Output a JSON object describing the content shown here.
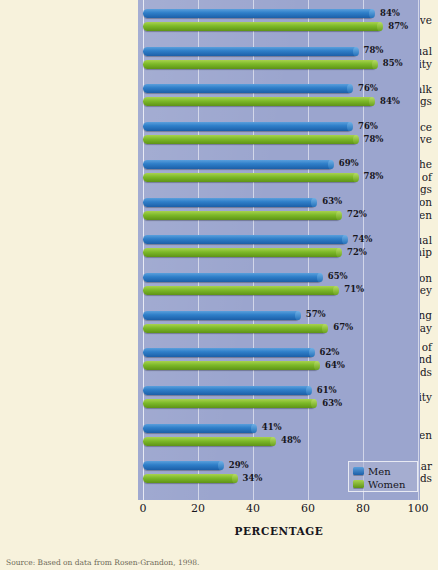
{
  "chart_data": {
    "type": "bar",
    "orientation": "horizontal",
    "title": "",
    "xlabel": "PERCENTAGE",
    "ylabel": "",
    "xlim": [
      0,
      100
    ],
    "xticks": [
      "0",
      "20",
      "40",
      "60",
      "80",
      "100"
    ],
    "grid": true,
    "legend_position": "bottom-right",
    "categories": [
      "Being in love",
      "Spouse's sexual fidelity",
      "Being able to talk together about feelings",
      "Keeping romance alive",
      "Being able to see the humorous side of things",
      "Having similar ideas on how to raise children",
      "Having a good sexual relationship",
      "Having similar ideas on how to handle money",
      "Spouse understanding what you do every day",
      "Liking the same kind of lifestyle, activities, and friends",
      "Financial security",
      "Having children",
      "Having similar backgrounds"
    ],
    "category_lines": [
      [
        "Being in love"
      ],
      [
        "Spouse's sexual",
        "fidelity"
      ],
      [
        "Being able to talk",
        "together about feelings"
      ],
      [
        "Keeping romance",
        "alive"
      ],
      [
        "Being able to see the",
        "humorous side of things"
      ],
      [
        "Having similar ideas on",
        "how to raise children"
      ],
      [
        "Having a good sexual",
        "relationship"
      ],
      [
        "Having similar ideas on",
        "how to handle money"
      ],
      [
        "Spouse understanding",
        "what you do every day"
      ],
      [
        "Liking the same kind of",
        "lifestyle, activities, and",
        "friends"
      ],
      [
        "Financial security"
      ],
      [
        "Having children"
      ],
      [
        "Having similar",
        "backgrounds"
      ]
    ],
    "series": [
      {
        "name": "Men",
        "color": "#2878c8",
        "values": [
          84,
          78,
          76,
          76,
          69,
          63,
          74,
          65,
          57,
          62,
          61,
          41,
          29
        ],
        "value_labels": [
          "84%",
          "78%",
          "76%",
          "76%",
          "69%",
          "63%",
          "74%",
          "65%",
          "57%",
          "62%",
          "61%",
          "41%",
          "29%"
        ]
      },
      {
        "name": "Women",
        "color": "#7cb928",
        "values": [
          87,
          85,
          84,
          78,
          78,
          72,
          72,
          71,
          67,
          64,
          63,
          48,
          34
        ],
        "value_labels": [
          "87%",
          "85%",
          "84%",
          "78%",
          "78%",
          "72%",
          "72%",
          "71%",
          "67%",
          "64%",
          "63%",
          "48%",
          "34%"
        ]
      }
    ]
  },
  "legend": {
    "items": [
      {
        "label": "Men",
        "key": "men"
      },
      {
        "label": "Women",
        "key": "women"
      }
    ]
  },
  "axis": {
    "title": "PERCENTAGE",
    "ticks": [
      {
        "label": "0",
        "value": 0
      },
      {
        "label": "20",
        "value": 20
      },
      {
        "label": "40",
        "value": 40
      },
      {
        "label": "60",
        "value": 60
      },
      {
        "label": "80",
        "value": 80
      },
      {
        "label": "100",
        "value": 100
      }
    ]
  },
  "source": {
    "text": "Source: Based on data from Rosen-Grandon, 1998."
  },
  "colors": {
    "men": "#2878c8",
    "women": "#7cb928",
    "plot_background": "#9ba5ce",
    "page_background": "#f7f2dc",
    "text": "#17161c"
  }
}
